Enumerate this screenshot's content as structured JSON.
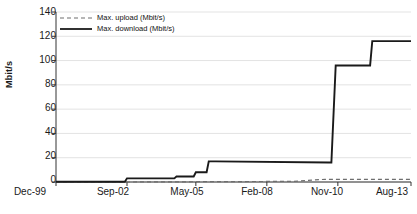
{
  "chart_data": {
    "type": "line",
    "title": "",
    "xlabel": "",
    "ylabel": "Mbit/s",
    "ylim": [
      0,
      140
    ],
    "yticks": [
      0,
      20,
      40,
      60,
      80,
      100,
      120,
      140
    ],
    "xticks": [
      "Dec-99",
      "Sep-02",
      "May-05",
      "Feb-08",
      "Nov-10",
      "Aug-13"
    ],
    "xlim_months": [
      0,
      165
    ],
    "grid": "horizontal",
    "legend_position": "top-left",
    "series": [
      {
        "name": "Max. upload (Mbit/s)",
        "style": "dashed",
        "color": "#6e6e6e",
        "x_months": [
          0,
          33,
          65,
          70,
          110,
          125,
          131,
          165
        ],
        "values": [
          0,
          0,
          0.2,
          0.3,
          0.5,
          2.2,
          2.2,
          2.2
        ]
      },
      {
        "name": "Max. download (Mbit/s)",
        "style": "solid",
        "color": "#1a1a1a",
        "x_months": [
          0,
          32,
          33,
          55,
          56,
          64,
          65,
          70,
          71,
          74,
          127,
          128,
          130,
          146,
          147,
          165
        ],
        "values": [
          0.2,
          0.2,
          3,
          3,
          4.5,
          4.5,
          8,
          8,
          17,
          17,
          16,
          16,
          96,
          96,
          116,
          116
        ]
      }
    ],
    "legend": [
      {
        "label": "Max. upload (Mbit/s)",
        "style": "dashed",
        "color": "#6e6e6e"
      },
      {
        "label": "Max. download (Mbit/s)",
        "style": "solid",
        "color": "#1a1a1a"
      }
    ],
    "colors": {
      "axis": "#333333",
      "grid": "#e3e3e3",
      "upload": "#6e6e6e",
      "download": "#1a1a1a",
      "background": "#ffffff"
    }
  }
}
